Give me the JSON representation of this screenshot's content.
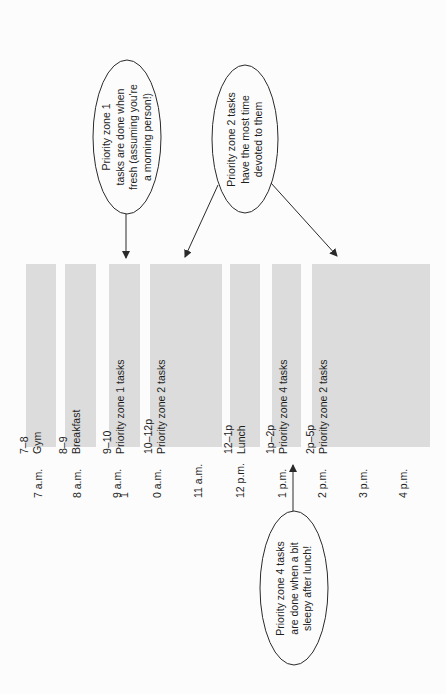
{
  "diagram": {
    "orientation": "rotated-90-ccw",
    "colors": {
      "background": "#fcfcfc",
      "block_fill": "#dcdcdc",
      "text": "#1e1e1e",
      "line": "#2a2a2a"
    },
    "schedule_blocks": [
      {
        "time_range": "7–8",
        "label": "Gym"
      },
      {
        "time_range": "8–9",
        "label": "Breakfast"
      },
      {
        "time_range": "9–10",
        "label": "Priority zone 1 tasks"
      },
      {
        "time_range": "10–12p",
        "label": "Priority zone 2 tasks"
      },
      {
        "time_range": "12–1p",
        "label": "Lunch"
      },
      {
        "time_range": "1p–2p",
        "label": "Priority zone 4 tasks"
      },
      {
        "time_range": "2p–5p",
        "label": "Priority zone 2 tasks"
      }
    ],
    "time_axis": [
      "7 a.m.",
      "8 a.m.",
      "9 a.m.",
      "1",
      "0 a.m.",
      "11 a.m.",
      "12 p.m.",
      "1 p.m.",
      "2 p.m.",
      "3 p.m.",
      "4 p.m."
    ],
    "callouts": [
      {
        "lines": [
          "Priority zone 1",
          "tasks are done when",
          "fresh (assuming you're",
          "a morning person!)"
        ],
        "points_to": "9–10 block"
      },
      {
        "lines": [
          "Priority zone 2 tasks",
          "have the most time",
          "devoted to them"
        ],
        "points_to": "10–12p and 2p–5p blocks"
      },
      {
        "lines": [
          "Priority zone 4 tasks",
          "are done when a bit",
          "sleepy after lunch!"
        ],
        "points_to": "1p–2p block"
      }
    ]
  }
}
